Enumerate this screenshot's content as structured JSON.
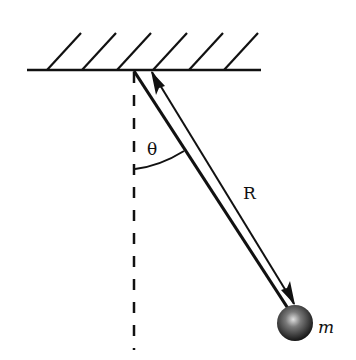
{
  "diagram": {
    "type": "pendulum",
    "labels": {
      "angle": "θ",
      "length": "R",
      "mass": "m"
    },
    "colors": {
      "line": "#111111",
      "background": "#ffffff",
      "bob_highlight": "#d8d8d8",
      "bob_shadow": "#1a1a1a"
    }
  }
}
